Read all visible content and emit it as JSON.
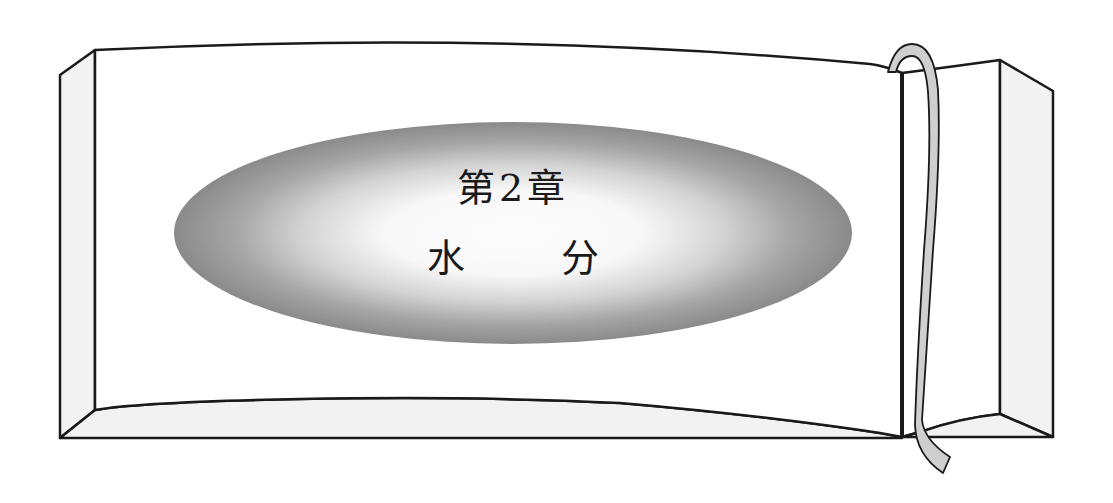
{
  "chapter": {
    "heading": "第2章",
    "title_chars": [
      "水",
      "分"
    ],
    "title": "水分"
  },
  "colors": {
    "outline": "#1a1a1a",
    "edge_fill": "#f2f2f2",
    "ellipse_outer": "#8c8c8c",
    "ellipse_center": "#ffffff",
    "ribbon_fill": "#cfcfcf"
  }
}
